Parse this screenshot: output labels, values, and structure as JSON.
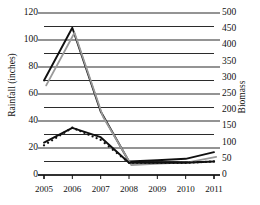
{
  "chart_data": {
    "type": "line",
    "title": "",
    "xlabel": "",
    "ylabel": "Rainfall (inches)",
    "ylabel_right": "Biomass",
    "categories": [
      "2005",
      "2006",
      "2007",
      "2008",
      "2009",
      "2010",
      "2011"
    ],
    "x": [
      2005,
      2006,
      2007,
      2008,
      2009,
      2010,
      2011
    ],
    "ylim": [
      0,
      120
    ],
    "yticks": [
      0,
      20,
      40,
      60,
      80,
      100,
      120
    ],
    "yticklabels": [
      "0",
      "20",
      "40",
      "60",
      "80",
      "100",
      "120"
    ],
    "y_minor_step": 10,
    "ylim_right": [
      0,
      500
    ],
    "yticks_right": [
      0,
      50,
      100,
      150,
      200,
      250,
      300,
      350,
      400,
      450,
      500
    ],
    "yticklabels_right": [
      "0",
      "50",
      "100",
      "150",
      "200",
      "250",
      "300",
      "350",
      "400",
      "450",
      "500"
    ],
    "grid": true,
    "legend": "none",
    "series": [
      {
        "name": "rainfall-line",
        "axis": "left",
        "style": "solid",
        "color": "#101010",
        "values": [
          70,
          109,
          47,
          10,
          11,
          12,
          17
        ]
      },
      {
        "name": "biomass-shadow-line",
        "axis": "left",
        "style": "solid",
        "color": "#9a9a9a",
        "values": [
          68,
          107,
          45,
          9,
          10,
          11,
          15
        ]
      },
      {
        "name": "biomass-smooth-line",
        "axis": "left",
        "style": "solid",
        "color": "#101010",
        "values": [
          24,
          35,
          28,
          9,
          9,
          9,
          10
        ]
      },
      {
        "name": "biomass-dotted-series",
        "axis": "left",
        "style": "dotted",
        "color": "#101010",
        "values": [
          22,
          35,
          26,
          9,
          9,
          9,
          10
        ]
      }
    ]
  },
  "axes": {
    "left_title": "Rainfall (inches)",
    "right_title": "Biomass"
  }
}
